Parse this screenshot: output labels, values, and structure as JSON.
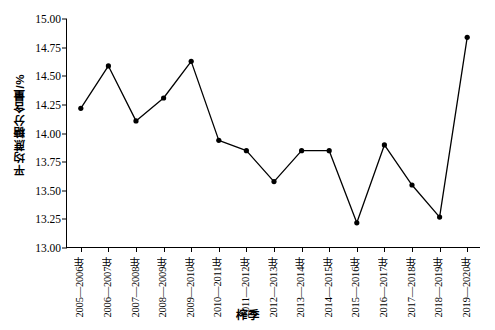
{
  "chart_data": {
    "type": "line",
    "title": "",
    "xlabel": "榨季",
    "ylabel": "平均蔗糖分含量/%",
    "ylim": [
      13.0,
      15.0
    ],
    "ytick_step": 0.25,
    "ytick_labels": [
      "15.00",
      "14.75",
      "14.50",
      "14.25",
      "14.00",
      "13.75",
      "13.50",
      "13.25",
      "13.00"
    ],
    "ytick_values": [
      15.0,
      14.75,
      14.5,
      14.25,
      14.0,
      13.75,
      13.5,
      13.25,
      13.0
    ],
    "grid": false,
    "legend": "none",
    "marker": "filled-circle",
    "line_color": "#000000",
    "marker_color": "#000000",
    "background_color": "#ffffff",
    "categories": [
      "2005—2006年",
      "2006—2007年",
      "2007—2008年",
      "2008—2009年",
      "2009—2010年",
      "2010—2011年",
      "2011—2012年",
      "2012—2013年",
      "2013—2014年",
      "2014—2015年",
      "2015—2016年",
      "2016—2017年",
      "2017—2018年",
      "2018—2019年",
      "2019—2020年"
    ],
    "values": [
      14.22,
      14.59,
      14.11,
      14.31,
      14.63,
      13.94,
      13.85,
      13.58,
      13.85,
      13.85,
      13.22,
      13.9,
      13.55,
      13.27,
      14.84
    ],
    "series": [
      {
        "name": "平均蔗糖分含量",
        "values": [
          14.22,
          14.59,
          14.11,
          14.31,
          14.63,
          13.94,
          13.85,
          13.58,
          13.85,
          13.85,
          13.22,
          13.9,
          13.55,
          13.27,
          14.84
        ]
      }
    ]
  }
}
